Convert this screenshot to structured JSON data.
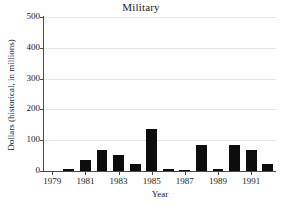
{
  "chart_data": {
    "type": "bar",
    "title": "Military",
    "xlabel": "Year",
    "ylabel": "Dollars (historical, in millions)",
    "categories": [
      1979,
      1980,
      1981,
      1982,
      1983,
      1984,
      1985,
      1986,
      1987,
      1988,
      1989,
      1990,
      1991,
      1992
    ],
    "values": [
      0,
      5,
      35,
      68,
      52,
      22,
      137,
      6,
      4,
      83,
      8,
      83,
      68,
      22
    ],
    "ylim": [
      0,
      500
    ],
    "ytick_labels": [
      "500",
      "400",
      "300",
      "200",
      "100",
      "0"
    ],
    "ytick_values": [
      500,
      400,
      300,
      200,
      100,
      0
    ],
    "xtick_labels": [
      "1979",
      "1981",
      "1983",
      "1985",
      "1987",
      "1989",
      "1991"
    ],
    "xtick_values": [
      1979,
      1981,
      1983,
      1985,
      1987,
      1989,
      1991
    ],
    "grid": true,
    "legend": false,
    "bar_color": "#0d0d0d",
    "gridline_color": "#e4e4e4",
    "axis_color": "#4a4a4a"
  }
}
